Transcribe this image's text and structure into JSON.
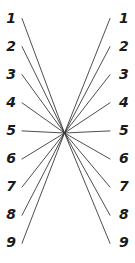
{
  "figure": {
    "name": "converging-lines-nomogram",
    "type": "line-diagram",
    "background_color": "#ffffff",
    "line_color": "#3a3a3a",
    "label_color": "#1a1a1a",
    "line_width": 0.9,
    "width": 135,
    "height": 263
  },
  "geometry": {
    "center_x": 64.5,
    "center_y": 133,
    "left_x": 22,
    "right_x": 110,
    "first_label_y": 18.5,
    "row_spacing": 28.1,
    "label_left_x": 16,
    "label_right_x": 119
  },
  "left_axis": {
    "name": "left-scale",
    "labels": [
      "1",
      "2",
      "3",
      "4",
      "5",
      "6",
      "7",
      "8",
      "9"
    ]
  },
  "right_axis": {
    "name": "right-scale",
    "labels": [
      "1",
      "2",
      "3",
      "4",
      "5",
      "6",
      "7",
      "8",
      "9"
    ]
  },
  "connections": [
    {
      "from": "1",
      "to": "1"
    },
    {
      "from": "2",
      "to": "2"
    },
    {
      "from": "3",
      "to": "3"
    },
    {
      "from": "4",
      "to": "4"
    },
    {
      "from": "5",
      "to": "5"
    },
    {
      "from": "6",
      "to": "6"
    },
    {
      "from": "7",
      "to": "7"
    },
    {
      "from": "8",
      "to": "8"
    },
    {
      "from": "9",
      "to": "9"
    }
  ],
  "chart_data": {
    "type": "line",
    "title": "",
    "xlabel": "",
    "ylabel": "",
    "categories": [
      "1",
      "2",
      "3",
      "4",
      "5",
      "6",
      "7",
      "8",
      "9"
    ],
    "series": [
      {
        "name": "left-endpoint-y",
        "values": [
          18.5,
          46.6,
          74.7,
          102.8,
          130.9,
          159.0,
          187.1,
          215.2,
          243.3
        ]
      },
      {
        "name": "right-endpoint-y",
        "values": [
          18.5,
          46.6,
          74.7,
          102.8,
          130.9,
          159.0,
          187.1,
          215.2,
          243.3
        ]
      }
    ],
    "grid": false,
    "legend": "none",
    "xlim": [
      0,
      135
    ],
    "ylim": [
      0,
      263
    ]
  }
}
